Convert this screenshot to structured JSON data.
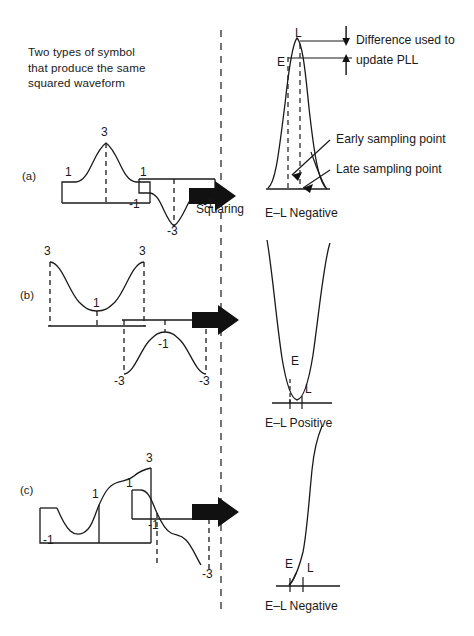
{
  "figure": {
    "title_note": "Two types of symbol that produce the same squared waveform",
    "note_lines": [
      "Two types of symbol",
      "that produce the same",
      "squared waveform"
    ],
    "process_label": "Squaring",
    "divider": "vertical-dashed-separator",
    "ink_color": "#1a1a1a",
    "background_color": "#ffffff"
  },
  "annotations": {
    "difference_line1": "Difference used to",
    "difference_line2": "update PLL",
    "early_sampling": "Early sampling point",
    "late_sampling": "Late sampling point"
  },
  "rows": [
    {
      "tag": "(a)",
      "input_peak_label": "3",
      "input_left_label": "1",
      "input_right_label": "1",
      "inverted_peak_label": "-3",
      "inverted_left_label": "-1",
      "inverted_right_label": "-1",
      "output_status": "E–L Negative",
      "early_mark": "E",
      "late_mark": "L"
    },
    {
      "tag": "(b)",
      "input_peak_label": "1",
      "input_left_label": "3",
      "input_right_label": "3",
      "inverted_peak_label": "-1",
      "inverted_left_label": "-3",
      "inverted_right_label": "-3",
      "output_status": "E–L Positive",
      "early_mark": "E",
      "late_mark": "L"
    },
    {
      "tag": "(c)",
      "input_peak_label": "3",
      "input_mid_label": "1",
      "input_low_label": "-1",
      "inverted_top_label": "1",
      "inverted_mid_label": "-1",
      "inverted_low_label": "-3",
      "output_status": "E–L Negative",
      "early_mark": "E",
      "late_mark": "L"
    }
  ]
}
